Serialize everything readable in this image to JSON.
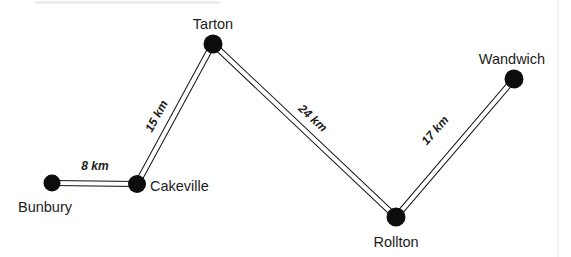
{
  "figure": {
    "background_color": "#ffffff",
    "node_color": "#0d0d0d",
    "road_color": "#111111",
    "text_color": "#1c1c1c",
    "frame_color": "#e3e3e3"
  },
  "nodes": [
    {
      "id": "bunbury",
      "label": "Bunbury",
      "x": 52,
      "y": 183,
      "r": 8.5,
      "label_x": 18,
      "label_y": 212,
      "anchor": "start"
    },
    {
      "id": "cakeville",
      "label": "Cakeville",
      "x": 137,
      "y": 184,
      "r": 9.0,
      "label_x": 150,
      "label_y": 191,
      "anchor": "start"
    },
    {
      "id": "tarton",
      "label": "Tarton",
      "x": 213,
      "y": 44,
      "r": 9.5,
      "label_x": 213,
      "label_y": 29,
      "anchor": "middle"
    },
    {
      "id": "rollton",
      "label": "Rollton",
      "x": 396,
      "y": 217,
      "r": 9.5,
      "label_x": 396,
      "label_y": 247,
      "anchor": "middle"
    },
    {
      "id": "wandwich",
      "label": "Wandwich",
      "x": 514,
      "y": 79,
      "r": 9.5,
      "label_x": 512,
      "label_y": 64,
      "anchor": "middle"
    }
  ],
  "edges": [
    {
      "id": "bunbury-cakeville",
      "from": "bunbury",
      "to": "cakeville",
      "distance_value": 8,
      "distance_unit": "km",
      "label": "8 km",
      "label_x": 95,
      "label_y": 170,
      "label_rotation": 0
    },
    {
      "id": "cakeville-tarton",
      "from": "cakeville",
      "to": "tarton",
      "distance_value": 15,
      "distance_unit": "km",
      "label": "15 km",
      "label_x": 160,
      "label_y": 118,
      "label_rotation": -61
    },
    {
      "id": "tarton-rollton",
      "from": "tarton",
      "to": "rollton",
      "distance_value": 24,
      "distance_unit": "km",
      "label": "24 km",
      "label_x": 310,
      "label_y": 121,
      "label_rotation": 40
    },
    {
      "id": "rollton-wandwich",
      "from": "rollton",
      "to": "wandwich",
      "distance_value": 17,
      "distance_unit": "km",
      "label": "17 km",
      "label_x": 438,
      "label_y": 133,
      "label_rotation": -52
    }
  ],
  "frame": {
    "right_rule_x": 558,
    "top_band_x": 35,
    "top_band_y": 1,
    "top_band_width": 185,
    "top_band_height": 3
  }
}
